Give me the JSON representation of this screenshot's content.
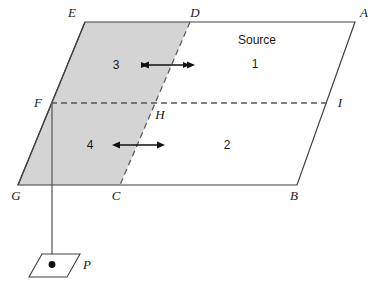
{
  "figure": {
    "background_color": "#ffffff",
    "stroke_color": "#404040",
    "shade_color": "#d4d4d4",
    "text_color": "#1a1a1a"
  },
  "vertex_labels": {
    "E": "E",
    "D": "D",
    "A": "A",
    "F": "F",
    "H": "H",
    "I": "I",
    "G": "G",
    "C": "C",
    "B": "B",
    "P": "P"
  },
  "region_labels": {
    "one": "1",
    "two": "2",
    "three": "3",
    "four": "4"
  },
  "annotations": {
    "source": "Source"
  },
  "geometry": {
    "main_parallelogram": "E(85,22) A(355,22) B(297,185) G(18,185)",
    "shaded_region": "E(85,22) D(190,22) C(120,185) G(18,185)",
    "dashed_DC": "D(190,22) to C(120,185)",
    "dashed_FI": "F(51,103) to I(330,103)",
    "drop_line": "F(51,103) to P(52,264)",
    "arrow_upper": "x 142 to 194 at y 65",
    "arrow_lower": "x 113 to 164 at y 145",
    "small_parallelogram_P": "(42,254) (80,254) (67,277) (29,277)",
    "point_P_dot": "(52,264)"
  }
}
